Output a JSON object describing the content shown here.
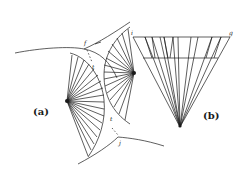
{
  "figure": {
    "panel_a": {
      "label": "(a)",
      "label_f": "f",
      "label_j": "j",
      "label_t1": "t",
      "label_t2": "t",
      "left_fan_center": [
        67,
        101
      ],
      "right_fan_center": [
        134,
        73
      ]
    },
    "panel_b": {
      "label": "(b)",
      "label_i": "i",
      "label_g": "g",
      "top_line": [
        [
          133,
          37
        ],
        [
          230,
          37
        ]
      ],
      "apex": [
        180,
        127
      ],
      "mid_line": [
        [
          143,
          58
        ],
        [
          218,
          58
        ]
      ]
    },
    "colors": {
      "ink": "#1a1a1a",
      "background": "#ffffff"
    }
  }
}
